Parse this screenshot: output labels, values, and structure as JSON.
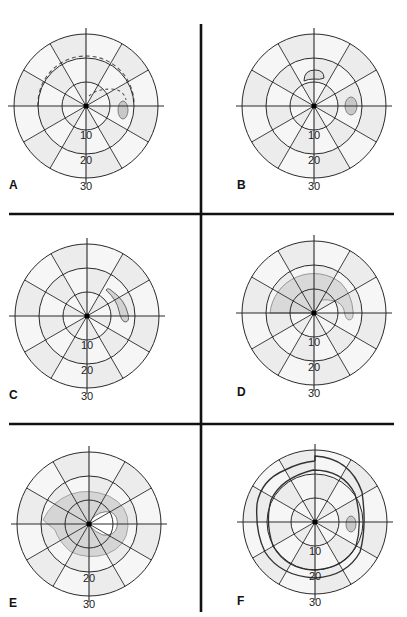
{
  "figure": {
    "ring_labels": [
      "10",
      "20",
      "30"
    ],
    "colors": {
      "background": "#ffffff",
      "sector_light": "#f6f6f6",
      "sector_dark": "#ececec",
      "grid_line": "#2a2a2a",
      "divider": "#111111",
      "blind_spot_fill": "#c8c8c8",
      "defect_fill": "#cfcfcf",
      "contour_line": "#3a3a3a"
    },
    "panels": [
      {
        "id": "A",
        "label": "A",
        "cx": 86,
        "cy": 106,
        "description": "Dashed arc (paracentral/arcuate contour) above fixation with physiological blind spot temporally"
      },
      {
        "id": "B",
        "label": "B",
        "cx": 314,
        "cy": 106,
        "description": "Small isolated superior paracentral scotoma with blind spot"
      },
      {
        "id": "C",
        "label": "C",
        "cx": 87,
        "cy": 316,
        "description": "Seidel-type extension of the blind spot upward"
      },
      {
        "id": "D",
        "label": "D",
        "cx": 314,
        "cy": 313,
        "description": "Superior arcuate (Bjerrum) scotoma arching from blind spot to nasal horizontal"
      },
      {
        "id": "E",
        "label": "E",
        "cx": 89,
        "cy": 524,
        "description": "Double arcuate / ring scotoma surrounding fixation"
      },
      {
        "id": "F",
        "label": "F",
        "cx": 315,
        "cy": 522,
        "description": "Constricted isopters with nasal step and blind spot"
      }
    ]
  }
}
